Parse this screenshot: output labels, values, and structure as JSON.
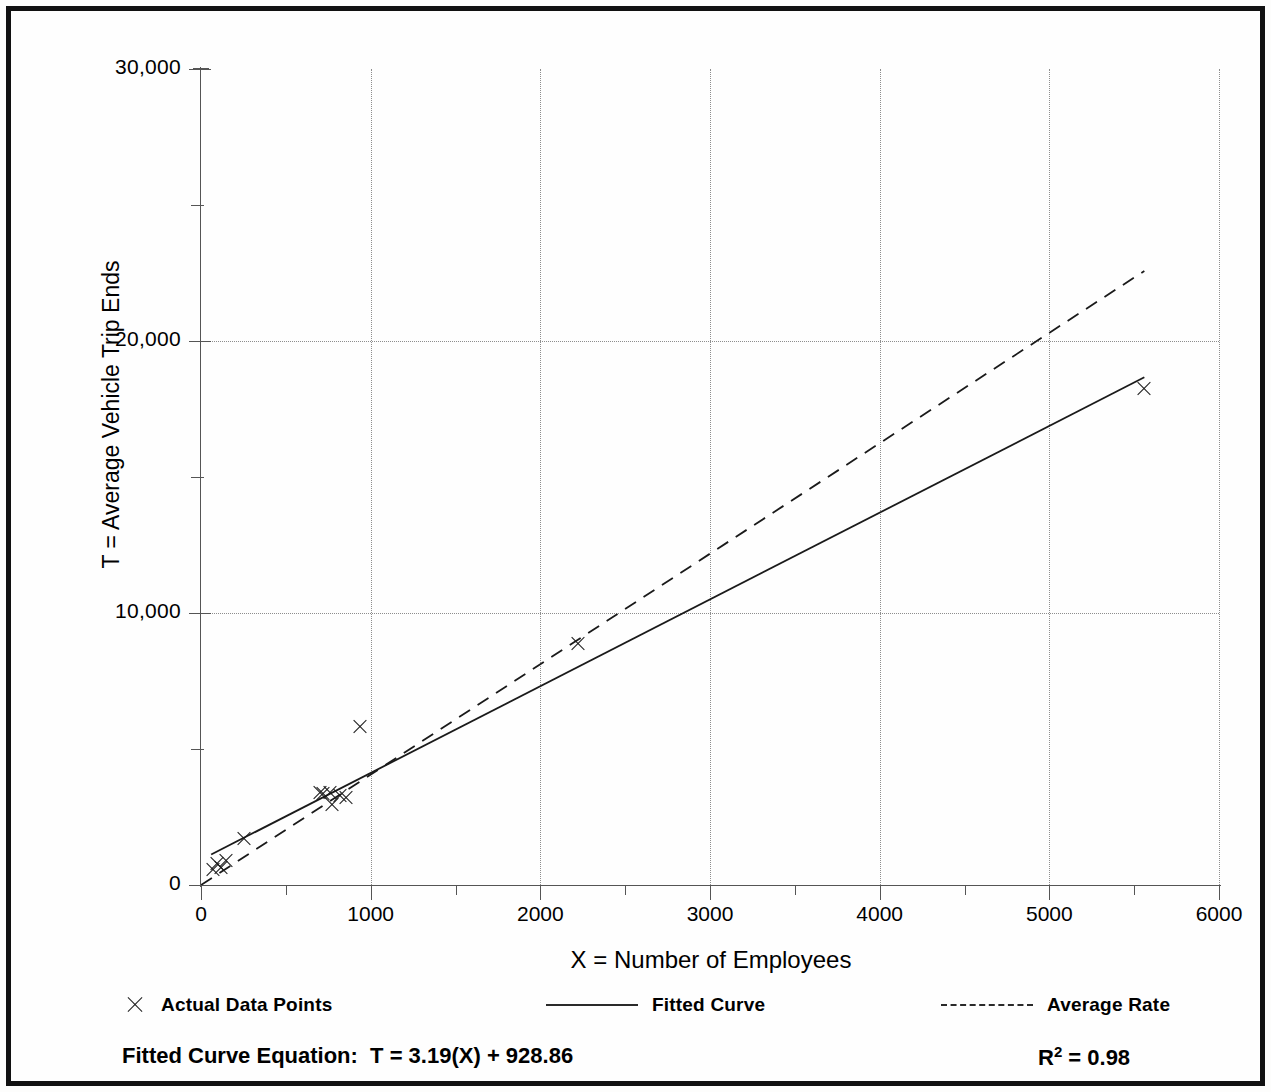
{
  "chart_data": {
    "type": "scatter",
    "title": "",
    "xlabel": "X = Number of Employees",
    "ylabel": "T = Average Vehicle Trip Ends",
    "xlim": [
      0,
      6000
    ],
    "ylim": [
      0,
      30000
    ],
    "x_ticks": [
      "0",
      "1000",
      "2000",
      "3000",
      "4000",
      "5000",
      "6000"
    ],
    "x_tick_values": [
      0,
      1000,
      2000,
      3000,
      4000,
      5000,
      6000
    ],
    "x_minor_step": 500,
    "y_ticks": [
      "0",
      "10,000",
      "20,000",
      "30,000"
    ],
    "y_tick_values": [
      0,
      10000,
      20000,
      30000
    ],
    "y_minor_step": 5000,
    "grid": true,
    "grid_style": "dotted",
    "legend_position": "below-axis",
    "series": [
      {
        "name": "Actual Data Points",
        "type": "scatter",
        "marker": "x",
        "points": [
          [
            70,
            560
          ],
          [
            95,
            780
          ],
          [
            120,
            640
          ],
          [
            150,
            880
          ],
          [
            255,
            1700
          ],
          [
            700,
            3400
          ],
          [
            720,
            3330
          ],
          [
            760,
            3380
          ],
          [
            775,
            2940
          ],
          [
            820,
            3280
          ],
          [
            855,
            3190
          ],
          [
            940,
            5800
          ],
          [
            2220,
            8850
          ],
          [
            5560,
            18250
          ]
        ]
      },
      {
        "name": "Fitted Curve",
        "type": "line",
        "style": "solid",
        "equation": "T = 3.19(X) + 928.86",
        "slope": 3.19,
        "intercept": 928.86,
        "x_range": [
          60,
          5560
        ]
      },
      {
        "name": "Average Rate",
        "type": "line",
        "style": "dashed",
        "slope": 4.06,
        "intercept": 0,
        "x_range": [
          0,
          5560
        ]
      }
    ],
    "annotations": {
      "equation_label": "Fitted Curve Equation:  T = 3.19(X) + 928.86",
      "r_squared_prefix": "R",
      "r_squared_exponent": "2",
      "r_squared_value": " = 0.98"
    }
  },
  "legend": {
    "items": [
      {
        "label": "Actual Data Points",
        "marker": "x"
      },
      {
        "label": "Fitted Curve",
        "marker": "solid-line"
      },
      {
        "label": "Average Rate",
        "marker": "dashed-line"
      }
    ]
  },
  "colors": {
    "ink": "#1a1a1a",
    "axis": "#555555",
    "grid": "#8d8d8d",
    "frame": "#111111",
    "background": "#fefefe"
  }
}
